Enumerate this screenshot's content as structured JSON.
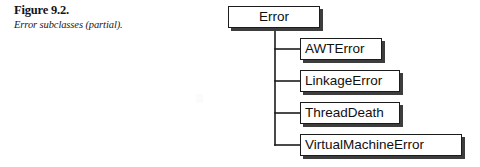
{
  "figure": {
    "caption_title": "Figure 9.2.",
    "caption_subtitle": "Error subclasses (partial)."
  },
  "diagram": {
    "type": "class-hierarchy-tree",
    "orientation": "left-to-right-indented",
    "root": {
      "label": "Error",
      "x": 228,
      "y": 6,
      "width": 92,
      "height": 22
    },
    "children": [
      {
        "label": "AWTError",
        "x": 300,
        "y": 38,
        "width": 82,
        "height": 22
      },
      {
        "label": "LinkageError",
        "x": 300,
        "y": 70,
        "width": 100,
        "height": 22
      },
      {
        "label": "ThreadDeath",
        "x": 300,
        "y": 102,
        "width": 100,
        "height": 22
      },
      {
        "label": "VirtualMachineError",
        "x": 300,
        "y": 134,
        "width": 162,
        "height": 22
      }
    ],
    "connector": {
      "trunk_x": 275,
      "trunk_top": 28,
      "trunk_bottom": 145,
      "branch_end_x": 300,
      "branch_ys": [
        49,
        81,
        113,
        145
      ],
      "line_color": "#1c1c1c",
      "line_width": 1.6
    },
    "style": {
      "box_fill": "#ffffff",
      "box_border": "#1c1c1c",
      "box_shadow": "#3d3d3d",
      "text_color": "#101010",
      "page_background": "#ffffff"
    }
  }
}
